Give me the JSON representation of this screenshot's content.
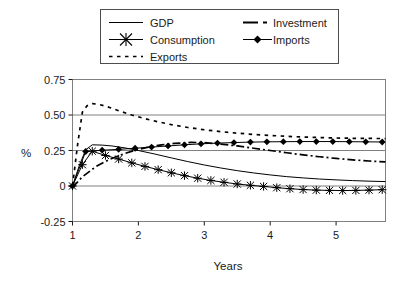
{
  "chart_data": {
    "type": "line",
    "title": "",
    "xlabel": "Years",
    "ylabel": "%",
    "xlim": [
      1,
      5.75
    ],
    "ylim": [
      -0.25,
      0.75
    ],
    "xticks": [
      1,
      2,
      3,
      4,
      5
    ],
    "xtick_labels": [
      "1",
      "2",
      "3",
      "4",
      "5"
    ],
    "yticks": [
      -0.25,
      0,
      0.25,
      0.5,
      0.75
    ],
    "ytick_labels": [
      "-0.25",
      "0",
      "0.25",
      "0.50",
      "0.75"
    ],
    "grid": true,
    "grid_orientation": "horizontal",
    "legend_position": "top",
    "legend_columns": 2,
    "series": [
      {
        "name": "GDP",
        "style": "solid",
        "marker": "none",
        "color": "#000000",
        "x": [
          1.0,
          1.1,
          1.2,
          1.3,
          1.45,
          1.6,
          1.8,
          2.0,
          2.25,
          2.5,
          2.75,
          3.0,
          3.25,
          3.5,
          3.75,
          4.0,
          4.25,
          4.5,
          4.75,
          5.0,
          5.25,
          5.5,
          5.75
        ],
        "values": [
          0.0,
          0.14,
          0.255,
          0.29,
          0.288,
          0.282,
          0.268,
          0.25,
          0.225,
          0.198,
          0.172,
          0.148,
          0.127,
          0.108,
          0.092,
          0.078,
          0.066,
          0.057,
          0.049,
          0.043,
          0.038,
          0.034,
          0.031
        ]
      },
      {
        "name": "Consumption",
        "style": "solid",
        "marker": "asterisk",
        "color": "#000000",
        "x": [
          1.0,
          1.15,
          1.3,
          1.5,
          1.7,
          1.9,
          2.1,
          2.3,
          2.5,
          2.7,
          2.9,
          3.1,
          3.3,
          3.5,
          3.7,
          3.9,
          4.1,
          4.3,
          4.5,
          4.7,
          4.9,
          5.1,
          5.3,
          5.5,
          5.7
        ],
        "values": [
          0.0,
          0.15,
          0.245,
          0.215,
          0.19,
          0.163,
          0.138,
          0.115,
          0.093,
          0.073,
          0.055,
          0.039,
          0.026,
          0.014,
          0.005,
          -0.003,
          -0.012,
          -0.019,
          -0.025,
          -0.029,
          -0.031,
          -0.032,
          -0.031,
          -0.029,
          -0.026
        ]
      },
      {
        "name": "Exports",
        "style": "dotted",
        "marker": "none",
        "color": "#000000",
        "x": [
          1.0,
          1.08,
          1.15,
          1.22,
          1.3,
          1.4,
          1.55,
          1.7,
          1.9,
          2.1,
          2.3,
          2.5,
          2.75,
          3.0,
          3.25,
          3.5,
          3.75,
          4.0,
          4.25,
          4.5,
          4.75,
          5.0,
          5.25,
          5.5,
          5.75
        ],
        "values": [
          0.0,
          0.3,
          0.52,
          0.565,
          0.58,
          0.575,
          0.555,
          0.53,
          0.5,
          0.474,
          0.452,
          0.432,
          0.412,
          0.396,
          0.383,
          0.372,
          0.363,
          0.356,
          0.35,
          0.345,
          0.341,
          0.338,
          0.336,
          0.335,
          0.334
        ]
      },
      {
        "name": "Investment",
        "style": "dashdot",
        "marker": "none",
        "color": "#000000",
        "x": [
          1.0,
          1.15,
          1.35,
          1.55,
          1.75,
          1.95,
          2.15,
          2.35,
          2.55,
          2.8,
          3.0,
          3.25,
          3.5,
          3.75,
          4.0,
          4.25,
          4.5,
          4.75,
          5.0,
          5.25,
          5.5,
          5.75
        ],
        "values": [
          -0.01,
          0.065,
          0.135,
          0.185,
          0.222,
          0.252,
          0.274,
          0.29,
          0.3,
          0.307,
          0.305,
          0.295,
          0.282,
          0.266,
          0.25,
          0.234,
          0.219,
          0.206,
          0.194,
          0.184,
          0.176,
          0.17
        ]
      },
      {
        "name": "Imports",
        "style": "solid",
        "marker": "diamond",
        "color": "#000000",
        "x": [
          1.0,
          1.2,
          1.45,
          1.7,
          1.95,
          2.2,
          2.45,
          2.7,
          2.95,
          3.2,
          3.45,
          3.7,
          3.95,
          4.2,
          4.45,
          4.7,
          4.95,
          5.2,
          5.45,
          5.7
        ],
        "values": [
          0.0,
          0.243,
          0.252,
          0.258,
          0.266,
          0.274,
          0.282,
          0.29,
          0.297,
          0.302,
          0.306,
          0.309,
          0.311,
          0.312,
          0.313,
          0.313,
          0.313,
          0.312,
          0.311,
          0.31
        ]
      }
    ]
  },
  "legend": {
    "entries": [
      {
        "label": "GDP",
        "key": "gdp"
      },
      {
        "label": "Investment",
        "key": "investment"
      },
      {
        "label": "Consumption",
        "key": "consumption"
      },
      {
        "label": "Imports",
        "key": "imports"
      },
      {
        "label": "Exports",
        "key": "exports"
      }
    ]
  },
  "axes": {
    "x_title": "Years",
    "y_title": "%"
  }
}
